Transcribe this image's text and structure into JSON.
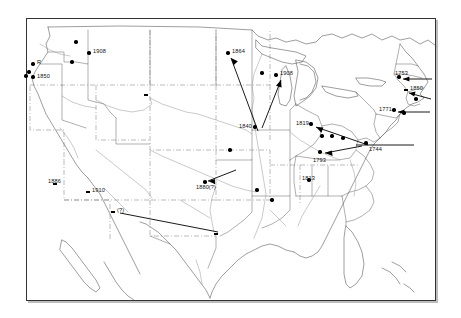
{
  "figure": {
    "kind": "historical-distribution-map",
    "region": "United States",
    "border_color": "#333333",
    "land_line_color": "#555555",
    "marker_color": "#000000",
    "background": "#ffffff"
  },
  "map": {
    "features": [
      "state-boundaries",
      "rivers",
      "coastline",
      "great-lakes",
      "baja-california",
      "florida-peninsula",
      "bahamas-islands"
    ]
  },
  "markers": [
    {
      "id": "m-wa-north",
      "label": "",
      "x": 76,
      "y": 42,
      "shape": "dot"
    },
    {
      "id": "m-wa-east",
      "label": "",
      "x": 72,
      "y": 62,
      "shape": "dot"
    },
    {
      "id": "m-id-1908",
      "label": "1908",
      "x": 89,
      "y": 53,
      "shape": "dot"
    },
    {
      "id": "m-or-r",
      "label": "R",
      "x": 33,
      "y": 64,
      "shape": "dot"
    },
    {
      "id": "m-or-a",
      "label": "",
      "x": 29,
      "y": 72,
      "shape": "dot"
    },
    {
      "id": "m-or-b",
      "label": "",
      "x": 26,
      "y": 76,
      "shape": "dot"
    },
    {
      "id": "m-or-1850",
      "label": "1850",
      "x": 33,
      "y": 77,
      "shape": "dot"
    },
    {
      "id": "m-mt-wy",
      "label": "",
      "x": 146,
      "y": 95,
      "shape": "dotsq"
    },
    {
      "id": "m-ne",
      "label": "",
      "x": 230,
      "y": 150,
      "shape": "dot"
    },
    {
      "id": "m-mn-1864",
      "label": "1864",
      "x": 228,
      "y": 53,
      "shape": "dot"
    },
    {
      "id": "m-wi",
      "label": "",
      "x": 262,
      "y": 73,
      "shape": "dot"
    },
    {
      "id": "m-mi-1908",
      "label": "1908",
      "x": 276,
      "y": 75,
      "shape": "dot"
    },
    {
      "id": "m-ia-1840",
      "label": "1840",
      "x": 255,
      "y": 127,
      "shape": "dot"
    },
    {
      "id": "m-il-1819",
      "label": "1819",
      "x": 311,
      "y": 124,
      "shape": "dot"
    },
    {
      "id": "m-in-a",
      "label": "",
      "x": 322,
      "y": 136,
      "shape": "dot"
    },
    {
      "id": "m-oh-a",
      "label": "",
      "x": 332,
      "y": 136,
      "shape": "dot"
    },
    {
      "id": "m-oh-b",
      "label": "",
      "x": 343,
      "y": 138,
      "shape": "dot"
    },
    {
      "id": "m-ky-1793",
      "label": "1793",
      "x": 320,
      "y": 152,
      "shape": "dot"
    },
    {
      "id": "m-va-1744",
      "label": "1744",
      "x": 366,
      "y": 143,
      "shape": "dot"
    },
    {
      "id": "m-pa-1771",
      "label": "1771",
      "x": 394,
      "y": 110,
      "shape": "dot"
    },
    {
      "id": "m-ny-1753",
      "label": "1753",
      "x": 399,
      "y": 77,
      "shape": "dot"
    },
    {
      "id": "m-ct-1850",
      "label": "1850",
      "x": 406,
      "y": 90,
      "shape": "dotsq"
    },
    {
      "id": "m-ma",
      "label": "",
      "x": 416,
      "y": 99,
      "shape": "dot"
    },
    {
      "id": "m-nj",
      "label": "",
      "x": 404,
      "y": 113,
      "shape": "dot"
    },
    {
      "id": "m-ks-1880",
      "label": "1880(?)",
      "x": 205,
      "y": 182,
      "shape": "dot"
    },
    {
      "id": "m-mo",
      "label": "",
      "x": 257,
      "y": 190,
      "shape": "dot"
    },
    {
      "id": "m-ar",
      "label": "",
      "x": 272,
      "y": 200,
      "shape": "dot"
    },
    {
      "id": "m-al-1813",
      "label": "1813",
      "x": 309,
      "y": 180,
      "shape": "dot"
    },
    {
      "id": "m-nm-1886",
      "label": "1886",
      "x": 55,
      "y": 184,
      "shape": "dotsq"
    },
    {
      "id": "m-az-1910",
      "label": "1910",
      "x": 88,
      "y": 192,
      "shape": "dotsq"
    },
    {
      "id": "m-tx-q",
      "label": "(?)",
      "x": 113,
      "y": 212,
      "shape": "dotsq"
    },
    {
      "id": "m-tx-gulf",
      "label": "",
      "x": 216,
      "y": 234,
      "shape": "dotsq"
    }
  ],
  "labels": [
    {
      "id": "L-1908-id",
      "text": "1908",
      "x": 93,
      "y": 49
    },
    {
      "id": "L-R",
      "text": "R",
      "x": 37,
      "y": 60
    },
    {
      "id": "L-1850-or",
      "text": "1850",
      "x": 37,
      "y": 74
    },
    {
      "id": "L-1864",
      "text": "1864",
      "x": 232,
      "y": 49
    },
    {
      "id": "L-1908-mi",
      "text": "1908",
      "x": 280,
      "y": 71
    },
    {
      "id": "L-1840",
      "text": "1840",
      "x": 239,
      "y": 124
    },
    {
      "id": "L-1819",
      "text": "1819",
      "x": 296,
      "y": 121
    },
    {
      "id": "L-1793",
      "text": "1793",
      "x": 313,
      "y": 158
    },
    {
      "id": "L-1744",
      "text": "1744",
      "x": 369,
      "y": 147
    },
    {
      "id": "L-1771",
      "text": "1771",
      "x": 379,
      "y": 107
    },
    {
      "id": "L-1753",
      "text": "1753",
      "x": 395,
      "y": 71
    },
    {
      "id": "L-1850-ct",
      "text": "1850",
      "x": 410,
      "y": 86
    },
    {
      "id": "L-1880",
      "text": "1880(?)",
      "x": 196,
      "y": 185
    },
    {
      "id": "L-1813",
      "text": "1813",
      "x": 302,
      "y": 176
    },
    {
      "id": "L-1886",
      "text": "1886",
      "x": 48,
      "y": 179
    },
    {
      "id": "L-1910",
      "text": "1910",
      "x": 92,
      "y": 188
    },
    {
      "id": "L-tx-q",
      "text": "(?)",
      "x": 117,
      "y": 208
    }
  ],
  "arrows": [
    {
      "id": "a-1840-to-1864",
      "from": [
        258,
        131
      ],
      "to": [
        231,
        58
      ],
      "head": "to"
    },
    {
      "id": "a-1840-to-1908",
      "from": [
        281,
        80
      ],
      "to": [
        262,
        128
      ],
      "head": "from"
    },
    {
      "id": "a-1744-to-1819",
      "from": [
        368,
        145
      ],
      "to": [
        316,
        127
      ],
      "head": "to"
    },
    {
      "id": "a-1744-east",
      "from": [
        356,
        145
      ],
      "to": [
        414,
        145
      ],
      "head": "none"
    },
    {
      "id": "a-1744-to-1793",
      "from": [
        362,
        146
      ],
      "to": [
        325,
        153
      ],
      "head": "to"
    },
    {
      "id": "a-1880-ne",
      "from": [
        236,
        170
      ],
      "to": [
        208,
        181
      ],
      "head": "to"
    },
    {
      "id": "a-1753-right",
      "from": [
        403,
        79
      ],
      "to": [
        432,
        79
      ],
      "head": "from"
    },
    {
      "id": "a-1771-right",
      "from": [
        398,
        112
      ],
      "to": [
        430,
        112
      ],
      "head": "from"
    },
    {
      "id": "a-ct-1850",
      "from": [
        409,
        93
      ],
      "to": [
        431,
        99
      ],
      "head": "from"
    },
    {
      "id": "a-tx-gulf",
      "from": [
        120,
        213
      ],
      "to": [
        218,
        232
      ],
      "head": "none"
    }
  ]
}
